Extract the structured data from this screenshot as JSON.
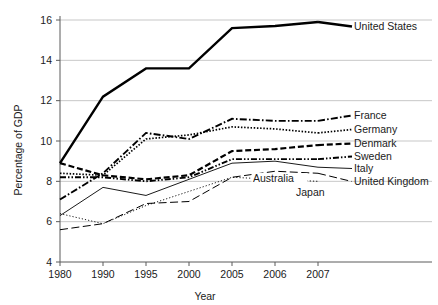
{
  "chart_data": {
    "type": "line",
    "title": "",
    "xlabel": "Year",
    "ylabel": "Percentage of GDP",
    "categories": [
      "1980",
      "1990",
      "1995",
      "2000",
      "2005",
      "2006",
      "2007"
    ],
    "ylim": [
      4,
      16
    ],
    "yticks": [
      "4",
      "6",
      "8",
      "10",
      "12",
      "14",
      "16"
    ],
    "grid": "horizontal",
    "legend_position": "right-inline",
    "series": [
      {
        "name": "United States",
        "values": [
          8.9,
          12.2,
          13.6,
          13.6,
          15.6,
          15.7,
          15.9
        ],
        "style": "solid-thick"
      },
      {
        "name": "France",
        "values": [
          7.1,
          8.4,
          10.4,
          10.1,
          11.1,
          11.0,
          11.0
        ],
        "style": "dash-dot"
      },
      {
        "name": "Germany",
        "values": [
          8.4,
          8.3,
          10.1,
          10.3,
          10.7,
          10.6,
          10.4
        ],
        "style": "dotted"
      },
      {
        "name": "Denmark",
        "values": [
          8.9,
          8.3,
          8.1,
          8.3,
          9.5,
          9.6,
          9.8
        ],
        "style": "dashed-thick"
      },
      {
        "name": "Sweden",
        "values": [
          8.2,
          8.2,
          8.0,
          8.2,
          9.1,
          9.1,
          9.1
        ],
        "style": "dash-dot-dot"
      },
      {
        "name": "Italy",
        "values": [
          6.3,
          7.7,
          7.3,
          8.1,
          8.9,
          9.0,
          8.7
        ],
        "style": "thin-solid"
      },
      {
        "name": "United Kingdom",
        "values": [
          5.6,
          5.9,
          6.9,
          7.0,
          8.2,
          8.5,
          8.4
        ],
        "style": "long-dash"
      },
      {
        "name": "Japan",
        "values": [
          6.4,
          5.9,
          6.8,
          7.5,
          8.2,
          8.1,
          8.0
        ],
        "style": "fine-dotted"
      }
    ],
    "right_labels": [
      "United States",
      "France",
      "Germany",
      "Denmark",
      "Sweden",
      "Italy",
      "United Kingdom"
    ],
    "inline_labels": [
      "Australia",
      "Japan"
    ]
  }
}
